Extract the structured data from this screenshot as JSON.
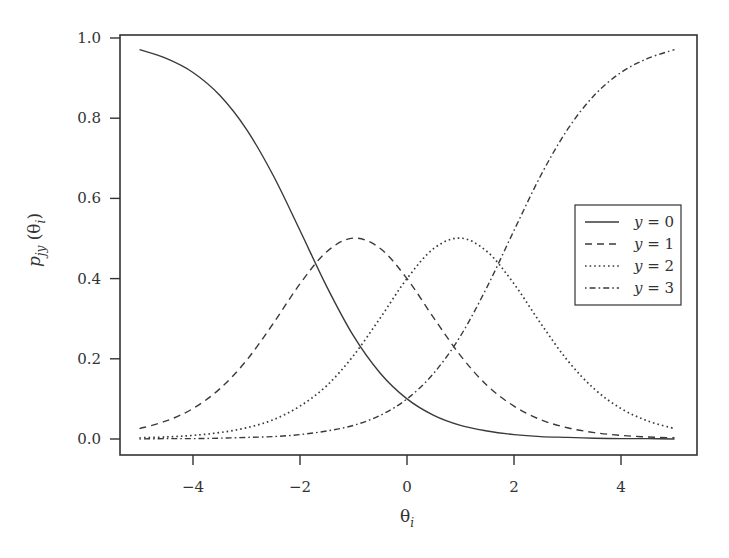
{
  "chart_data": {
    "type": "line",
    "title": "",
    "xlabel": "θ_i",
    "ylabel": "p_jy(θ_i)",
    "xlim": [
      -5.4,
      5.4
    ],
    "ylim": [
      -0.04,
      1.02
    ],
    "xticks": [
      -4,
      -2,
      0,
      2,
      4
    ],
    "xtick_labels": [
      "−4",
      "−2",
      "0",
      "2",
      "4"
    ],
    "yticks": [
      0.0,
      0.2,
      0.4,
      0.6,
      0.8,
      1.0
    ],
    "ytick_labels": [
      "0.0",
      "0.2",
      "0.4",
      "0.6",
      "0.8",
      "1.0"
    ],
    "grid": false,
    "legend_position": "right-center",
    "x": [
      -5,
      -4.5,
      -4,
      -3.5,
      -3,
      -2.5,
      -2,
      -1.5,
      -1,
      -0.5,
      0,
      0.5,
      1,
      1.5,
      2,
      2.5,
      3,
      3.5,
      4,
      4.5,
      5
    ],
    "series": [
      {
        "name": "y = 0",
        "style": "solid",
        "values": [
          0.971,
          0.949,
          0.914,
          0.857,
          0.772,
          0.657,
          0.52,
          0.38,
          0.257,
          0.164,
          0.1,
          0.059,
          0.034,
          0.02,
          0.011,
          0.006,
          0.004,
          0.002,
          0.001,
          0.001,
          0.0
        ]
      },
      {
        "name": "y = 1",
        "style": "dashed",
        "values": [
          0.026,
          0.045,
          0.076,
          0.125,
          0.196,
          0.288,
          0.387,
          0.467,
          0.501,
          0.475,
          0.4,
          0.302,
          0.208,
          0.133,
          0.082,
          0.048,
          0.028,
          0.016,
          0.009,
          0.005,
          0.003
        ]
      },
      {
        "name": "y = 2",
        "style": "dotted",
        "values": [
          0.003,
          0.005,
          0.009,
          0.016,
          0.028,
          0.048,
          0.082,
          0.133,
          0.208,
          0.302,
          0.4,
          0.475,
          0.501,
          0.467,
          0.387,
          0.288,
          0.196,
          0.125,
          0.076,
          0.045,
          0.026
        ]
      },
      {
        "name": "y = 3",
        "style": "dashdot",
        "values": [
          0.0,
          0.001,
          0.001,
          0.002,
          0.004,
          0.006,
          0.011,
          0.02,
          0.034,
          0.059,
          0.1,
          0.164,
          0.257,
          0.38,
          0.52,
          0.657,
          0.772,
          0.857,
          0.914,
          0.949,
          0.971
        ]
      }
    ]
  },
  "labels": {
    "xlabel_main": "θ",
    "xlabel_sub": "i",
    "ylabel_main": "p",
    "ylabel_sub": "jy",
    "ylabel_arg_open": " (θ",
    "ylabel_arg_sub": "i",
    "ylabel_arg_close": ")"
  },
  "legend": {
    "items": [
      {
        "label": "y = 0",
        "var": "y",
        "eq": " = 0"
      },
      {
        "label": "y = 1",
        "var": "y",
        "eq": " = 1"
      },
      {
        "label": "y = 2",
        "var": "y",
        "eq": " = 2"
      },
      {
        "label": "y = 3",
        "var": "y",
        "eq": " = 3"
      }
    ]
  },
  "colors": {
    "line": "#3a3a3a",
    "frame": "#333333",
    "background": "#ffffff"
  }
}
